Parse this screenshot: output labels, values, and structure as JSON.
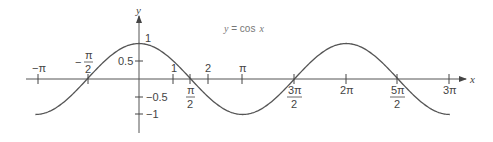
{
  "chart_data": {
    "type": "line",
    "xlabel": "x",
    "ylabel": "y",
    "series": [
      {
        "name": "y = cos x",
        "function": "cos(x)",
        "x_range": [
          -3.14159,
          9.42478
        ]
      }
    ],
    "x_ticks": [
      {
        "value": -3.14159,
        "label": "−π"
      },
      {
        "value": -1.5708,
        "label": "−π/2"
      },
      {
        "value": 1,
        "label": "1"
      },
      {
        "value": 1.5708,
        "label": "π/2"
      },
      {
        "value": 2,
        "label": "2"
      },
      {
        "value": 3.14159,
        "label": "π"
      },
      {
        "value": 4.71239,
        "label": "3π/2"
      },
      {
        "value": 6.28319,
        "label": "2π"
      },
      {
        "value": 7.85398,
        "label": "5π/2"
      },
      {
        "value": 9.42478,
        "label": "3π"
      }
    ],
    "y_ticks": [
      {
        "value": 1,
        "label": "1"
      },
      {
        "value": 0.5,
        "label": "0.5"
      },
      {
        "value": -0.5,
        "label": "−0.5"
      },
      {
        "value": -1,
        "label": "−1"
      }
    ],
    "xlim": [
      -3.14159,
      9.42478
    ],
    "ylim": [
      -1,
      1
    ],
    "grid": false,
    "legend": "none"
  },
  "labels": {
    "title_lhs": "y",
    "title_eq": " = ",
    "title_fn": "cos",
    "title_var": "x",
    "y_axis": "y",
    "x_axis": "x",
    "neg_pi": "−π",
    "neg_half_pi_num": "π",
    "neg_half_pi_den": "2",
    "neg_sign": "−",
    "one_x": "1",
    "half_pi_num": "π",
    "half_pi_den": "2",
    "two_x": "2",
    "pi": "π",
    "three_half_pi_num": "3π",
    "three_half_pi_den": "2",
    "two_pi": "2π",
    "five_half_pi_num": "5π",
    "five_half_pi_den": "2",
    "three_pi": "3π",
    "y_one": "1",
    "y_half": "0.5",
    "y_neg_half": "−0.5",
    "y_neg_one": "−1"
  },
  "colors": {
    "curve": "#555555",
    "axis": "#555555",
    "text": "#444444"
  }
}
